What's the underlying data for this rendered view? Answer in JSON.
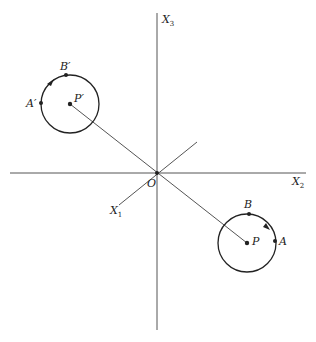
{
  "figure": {
    "type": "3D coordinate axes with two circles reflected through origin",
    "colors": {
      "line": "#333333",
      "axis": "#555555",
      "label": "#222222"
    }
  },
  "axes": {
    "x1": {
      "label": "X",
      "subscript": "1"
    },
    "x2": {
      "label": "X",
      "subscript": "2"
    },
    "x3": {
      "label": "X",
      "subscript": "3"
    },
    "origin": {
      "label": "O"
    }
  },
  "circles": [
    {
      "center_label": "P",
      "points": [
        {
          "label": "A"
        },
        {
          "label": "B"
        }
      ],
      "direction": "counterclockwise arrow between A and B"
    },
    {
      "center_label": "P′",
      "points": [
        {
          "label": "A′"
        },
        {
          "label": "B′"
        }
      ],
      "direction": "arrow between B′ and A′"
    }
  ]
}
